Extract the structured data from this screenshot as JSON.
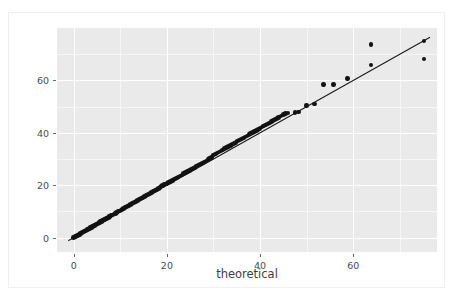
{
  "figure": {
    "background": "#ffffff",
    "panel_background": "#eaeaea",
    "grid_color": "#ffffff",
    "marker_color": "#121212",
    "line_color": "#1a1a1a"
  },
  "chart_data": {
    "type": "scatter",
    "title": "",
    "xlabel": "theoretical",
    "ylabel": "sample",
    "xlim": [
      -3.6,
      78.0
    ],
    "ylim": [
      -5.5,
      80.0
    ],
    "xticks": [
      0,
      20,
      40,
      60
    ],
    "xticklabels": [
      "0",
      "20",
      "40",
      "60"
    ],
    "yticks": [
      0,
      20,
      40,
      60
    ],
    "yticklabels": [
      "0",
      "20",
      "40",
      "60"
    ],
    "grid": true,
    "legend": null,
    "series": [
      {
        "name": "quantile-points",
        "type": "scatter",
        "marker": "o",
        "color": "#121212",
        "x": [
          0.0,
          0.2,
          0.4,
          0.6,
          0.8,
          1.0,
          1.2,
          1.4,
          1.6,
          1.8,
          2.0,
          2.2,
          2.4,
          2.6,
          2.8,
          3.0,
          3.2,
          3.4,
          3.6,
          3.8,
          4.0,
          4.2,
          4.4,
          4.6,
          4.8,
          5.0,
          5.2,
          5.4,
          5.6,
          5.8,
          6.0,
          6.2,
          6.4,
          6.6,
          6.8,
          7.0,
          7.2,
          7.4,
          7.6,
          7.8,
          8.0,
          8.3,
          8.6,
          8.9,
          9.2,
          9.5,
          9.8,
          10.1,
          10.4,
          10.7,
          11.0,
          11.3,
          11.6,
          11.9,
          12.2,
          12.5,
          12.8,
          13.1,
          13.4,
          13.7,
          14.0,
          14.3,
          14.6,
          14.9,
          15.2,
          15.5,
          15.8,
          16.1,
          16.4,
          16.7,
          17.0,
          17.3,
          17.6,
          17.9,
          18.2,
          18.5,
          18.8,
          19.1,
          19.4,
          19.7,
          20.0,
          20.4,
          20.8,
          21.2,
          21.6,
          22.0,
          22.4,
          22.8,
          23.2,
          23.6,
          24.0,
          24.4,
          24.8,
          25.2,
          25.6,
          26.0,
          26.4,
          26.8,
          27.2,
          27.6,
          28.0,
          28.4,
          28.8,
          29.2,
          29.6,
          30.0,
          30.4,
          30.8,
          31.2,
          31.6,
          32.0,
          32.4,
          32.8,
          33.2,
          33.6,
          34.0,
          34.4,
          34.8,
          35.2,
          35.6,
          36.0,
          36.4,
          36.8,
          37.2,
          37.6,
          38.0,
          38.4,
          38.8,
          39.2,
          39.6,
          40.0,
          40.4,
          40.8,
          41.2,
          41.6,
          42.0,
          42.4,
          42.8,
          43.2,
          43.6,
          44.0,
          44.5,
          45.0,
          45.5,
          46.0,
          47.5,
          48.3,
          50.0,
          51.7,
          53.6,
          55.8,
          58.8,
          63.8,
          75.2
        ],
        "y": [
          0.0,
          0.2,
          0.45,
          0.65,
          0.85,
          1.05,
          1.25,
          1.5,
          1.7,
          1.9,
          2.1,
          2.3,
          2.5,
          2.7,
          2.95,
          3.15,
          3.35,
          3.55,
          3.75,
          3.95,
          4.2,
          4.4,
          4.6,
          4.8,
          5.0,
          5.2,
          5.45,
          5.65,
          5.85,
          6.05,
          6.25,
          6.5,
          6.7,
          6.9,
          7.1,
          7.3,
          7.5,
          7.75,
          7.95,
          8.15,
          8.35,
          8.65,
          8.95,
          9.25,
          9.55,
          9.9,
          10.2,
          10.5,
          10.8,
          11.1,
          11.4,
          11.7,
          12.0,
          12.3,
          12.6,
          12.95,
          13.25,
          13.55,
          13.85,
          14.15,
          14.45,
          14.75,
          15.05,
          15.4,
          15.7,
          16.0,
          16.3,
          16.6,
          16.9,
          17.2,
          17.5,
          17.85,
          18.15,
          18.45,
          18.75,
          19.05,
          19.7,
          19.95,
          20.2,
          20.45,
          20.7,
          21.1,
          21.5,
          21.9,
          22.3,
          22.75,
          23.15,
          23.55,
          23.95,
          24.35,
          24.8,
          25.2,
          25.6,
          26.0,
          26.4,
          26.85,
          27.25,
          27.65,
          28.05,
          28.45,
          28.9,
          29.3,
          29.7,
          30.1,
          30.5,
          31.5,
          31.9,
          32.3,
          32.7,
          33.1,
          33.5,
          33.95,
          34.35,
          34.75,
          35.15,
          35.55,
          36.0,
          36.4,
          36.8,
          37.2,
          37.6,
          38.05,
          38.45,
          38.85,
          39.25,
          39.65,
          40.1,
          40.5,
          40.9,
          41.3,
          41.7,
          42.15,
          42.6,
          43.0,
          43.4,
          43.8,
          44.3,
          44.7,
          45.1,
          45.5,
          45.9,
          46.4,
          46.9,
          47.3,
          47.6,
          47.8,
          48.0,
          50.4,
          51.0,
          58.5,
          58.5,
          60.8,
          65.8,
          68.2
        ],
        "extra_points": [
          {
            "x": 63.8,
            "y": 73.8
          },
          {
            "x": 75.2,
            "y": 75.0
          }
        ]
      },
      {
        "name": "reference-line",
        "type": "line",
        "color": "#1a1a1a",
        "x": [
          -1.2,
          76.5
        ],
        "y": [
          -1.2,
          76.5
        ]
      }
    ]
  }
}
